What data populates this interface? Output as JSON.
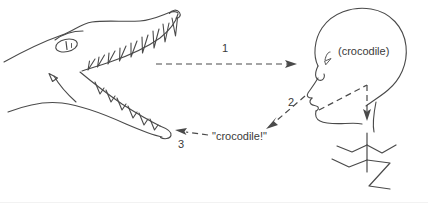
{
  "figure": {
    "title": "",
    "background_color": "#ffffff",
    "ink_color": "#4a4a4a",
    "text_color": "#3a3a3a",
    "width": 428,
    "height": 203
  },
  "labels": {
    "step_1": "1",
    "step_2": "2",
    "step_3": "3",
    "percept": "(crocodile)",
    "utterance": "\"crocodile!\""
  },
  "elements": {
    "crocodile_head": "crocodile-head-drawing",
    "human_head": "human-head-profile-drawing",
    "human_body": "human-body-stick-figure-drawing",
    "arrow_1": "dashed-arrow-crocodile-to-head",
    "arrow_2": "dashed-arrow-head-to-utterance",
    "arrow_3": "dashed-arrow-utterance-to-crocodile",
    "arrow_percept_to_body": "dashed-arrow-head-to-body"
  },
  "arrow_style": {
    "dash_pattern": "6 4",
    "stroke_width": 1.2,
    "color": "#4a4a4a"
  }
}
